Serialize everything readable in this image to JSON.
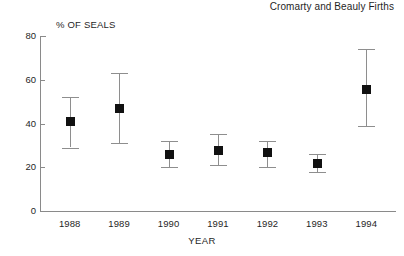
{
  "chart_data": {
    "type": "scatter",
    "title": "Cromarty and Beauly Firths",
    "xlabel": "YEAR",
    "ylabel": "% OF SEALS",
    "categories": [
      "1988",
      "1989",
      "1990",
      "1991",
      "1992",
      "1993",
      "1994"
    ],
    "values": [
      41,
      47,
      26,
      28,
      27,
      22,
      56
    ],
    "error_low": [
      29,
      31,
      20,
      21,
      20,
      18,
      39
    ],
    "error_high": [
      52,
      63,
      32,
      35,
      32,
      26,
      74
    ],
    "ylim": [
      0,
      80
    ],
    "yticks": [
      0,
      20,
      40,
      60,
      80
    ],
    "ytick_labels": [
      "0",
      "20",
      "40",
      "60",
      "80"
    ],
    "grid": false,
    "legend": null,
    "marker_color": "#111111",
    "errorbar_color": "#8e8e8e",
    "axis_color": "#8a8a8a",
    "series_name": "% of seals"
  },
  "axis": {
    "ytick_0": "0",
    "ytick_20": "20",
    "ytick_40": "40",
    "ytick_60": "60",
    "ytick_80": "80",
    "xtick_0": "1988",
    "xtick_1": "1989",
    "xtick_2": "1990",
    "xtick_3": "1991",
    "xtick_4": "1992",
    "xtick_5": "1993",
    "xtick_6": "1994"
  }
}
